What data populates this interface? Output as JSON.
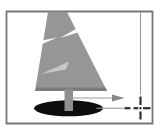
{
  "illustration": {
    "name": "tree-with-snap-target",
    "background": "#ffffff",
    "frame": {
      "stroke": "#777777",
      "path": "M6.5 11.5 H152.5 V123.5 H6.5 Z"
    },
    "tree": {
      "canopy": {
        "fill": "#969696",
        "points": "48,12 67,12 107,91 35,91"
      },
      "canopy_base_shade": {
        "fill": "#7b7b7b",
        "points": "36.3,87.5 105.7,87.5 107,91 35,91"
      },
      "notch_right": {
        "fill": "#ffffff",
        "points": "91,20.5 95,27 60,38"
      },
      "notch_left": {
        "fill": "#ffffff",
        "points": "31,49 33,42.5 57,37.5"
      },
      "highlight_slash": {
        "fill": "#c7c7c7",
        "points": "69,61.5 66,69.5 41,74"
      },
      "shadow": {
        "fill": "#0d0d0d",
        "path": "M34 108.3 A34.5 8 0 1 0 103 108.3 A34.5 8 0 1 0 34 108.3 Z"
      },
      "trunk": {
        "fill": "#8f8f8f",
        "path": "M64.5 89 H73 V111 H64.5 Z"
      }
    },
    "guides": {
      "color": "#9a9a9a",
      "vertical_line": "M140.5 12.5 V94.5",
      "arrow_line": "M73 98 H113",
      "arrowhead": {
        "fill": "#878787",
        "points": "112,94.4 124.5,98 112,101.6"
      },
      "horizontal_line": "M96.5 108.2 H123.5"
    },
    "crosshair": {
      "color": "#2f2f2f",
      "dashes": {
        "top": "M140.5 96.5 V105",
        "bottom": "M140.5 111.5 V119.5",
        "left_outer": "M124.5 108.2 H130.5",
        "left_inner": "M133.5 108.2 H138.3",
        "center": "M139.4 108.2 H141.6",
        "right": "M143 108.2 H150.5"
      }
    }
  }
}
